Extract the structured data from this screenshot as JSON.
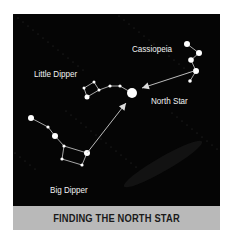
{
  "caption": "FINDING THE NORTH STAR",
  "labels": {
    "cassiopeia": "Cassiopeia",
    "little_dipper": "Little Dipper",
    "north_star": "North Star",
    "big_dipper": "Big Dipper"
  },
  "colors": {
    "sky": "#050505",
    "star": "#ffffff",
    "line": "#cfcfcf",
    "caption_band": "#b9b9b9",
    "caption_text": "#1a1a1a"
  }
}
